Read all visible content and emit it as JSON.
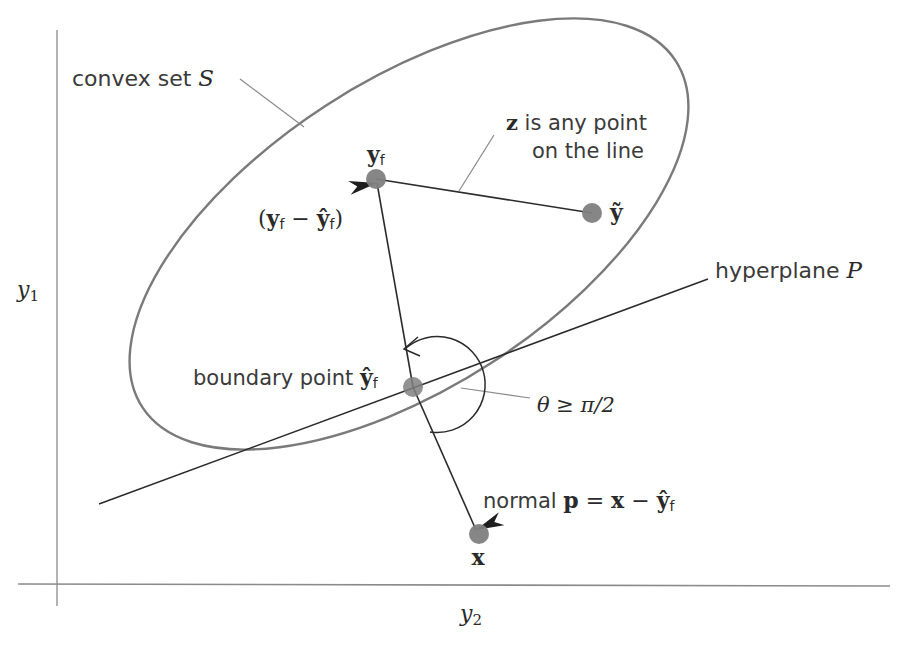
{
  "figure": {
    "type": "geometric-diagram",
    "axes": {
      "vertical_label": "y",
      "vertical_label_sub": "1",
      "horizontal_label": "y",
      "horizontal_label_sub": "2"
    },
    "labels": {
      "convex_set": "convex set ",
      "convex_set_symbol": "S",
      "z_bold": "z",
      "z_line1": " is any point",
      "z_line2": "on the line",
      "yf_bold": "y",
      "yf_sub": "f",
      "ytilde_bold": "ỹ",
      "diff_open": "(",
      "diff_y": "y",
      "diff_sub1": "f",
      "diff_minus": " − ",
      "diff_yhat": "ŷ",
      "diff_sub2": "f",
      "diff_close": ")",
      "hyperplane": "hyperplane ",
      "hyperplane_symbol": "P",
      "boundary": "boundary point ",
      "boundary_yhat": "ŷ",
      "boundary_sub": "f",
      "theta": "θ ≥ π/2",
      "normal": "normal ",
      "normal_p": "p",
      "normal_eq": " = ",
      "normal_x": "x",
      "normal_minus": " − ",
      "normal_yhat": "ŷ",
      "normal_sub": "f",
      "x_point": "x"
    },
    "points": {
      "y_f": [
        376,
        179
      ],
      "y_tilde": [
        592,
        213
      ],
      "y_hat_f": [
        413,
        387
      ],
      "x": [
        479,
        534
      ]
    },
    "colors": {
      "ellipse": "#7a7a7a",
      "lines": "#2b2b2b",
      "points": "#808080",
      "axes": "#8a8a8a",
      "leader": "#8a8a8a"
    }
  }
}
